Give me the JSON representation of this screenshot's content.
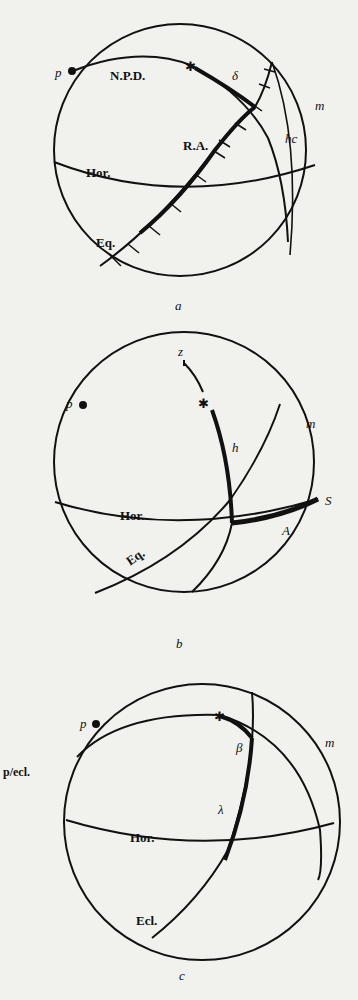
{
  "figures": [
    {
      "id": "a",
      "caption": "a",
      "labels": {
        "pole": "p",
        "npd": "N.P.D.",
        "declination": "δ",
        "meridian": "m",
        "hour_circle": "hc",
        "right_ascension": "R.A.",
        "horizon": "Hor.",
        "equator": "Eq."
      },
      "star_glyph": "✱"
    },
    {
      "id": "b",
      "caption": "b",
      "labels": {
        "zenith": "z",
        "pole": "p",
        "meridian": "m",
        "altitude": "h",
        "south": "S",
        "horizon": "Hor.",
        "azimuth": "A",
        "equator": "Eq."
      },
      "star_glyph": "✱"
    },
    {
      "id": "c",
      "caption": "c",
      "side_label": "p/ecl.",
      "labels": {
        "pole": "p",
        "latitude": "β",
        "meridian": "m",
        "longitude": "λ",
        "horizon": "Hor.",
        "ecliptic": "Ecl."
      },
      "star_glyph": "✱"
    }
  ]
}
